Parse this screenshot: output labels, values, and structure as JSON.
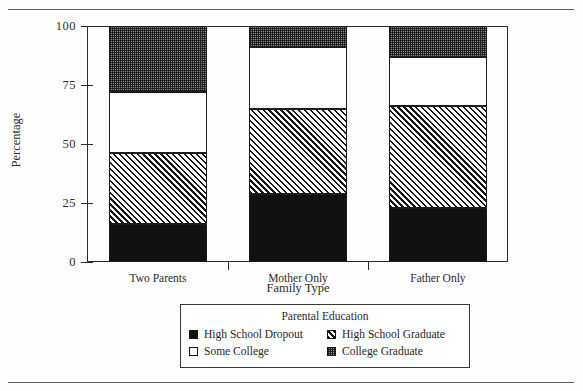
{
  "chart_data": {
    "type": "bar",
    "subtype": "stacked-100",
    "title": "",
    "xlabel": "Family Type",
    "ylabel": "Percentage",
    "ylim": [
      0,
      100
    ],
    "yticks": [
      0,
      25,
      50,
      75,
      100
    ],
    "ytick_labels": [
      "0",
      "25",
      "50",
      "75",
      "100"
    ],
    "grid": false,
    "legend_position": "bottom-center",
    "legend_title": "Parental Education",
    "categories": [
      "Two Parents",
      "Mother Only",
      "Father Only"
    ],
    "series": [
      {
        "name": "High School Dropout",
        "pattern": "solid-black",
        "values": [
          16,
          29,
          23
        ]
      },
      {
        "name": "High School Graduate",
        "pattern": "diagonal-hatch",
        "values": [
          30,
          36,
          43
        ]
      },
      {
        "name": "Some College",
        "pattern": "open-white",
        "values": [
          26,
          26,
          21
        ]
      },
      {
        "name": "College Graduate",
        "pattern": "dotted-gray",
        "values": [
          28,
          9,
          13
        ]
      }
    ],
    "cumulative_tops": {
      "Two Parents": [
        16,
        46,
        72,
        100
      ],
      "Mother Only": [
        29,
        65,
        91,
        100
      ],
      "Father Only": [
        23,
        66,
        87,
        100
      ]
    }
  },
  "legend": {
    "title": "Parental Education",
    "items": [
      {
        "label": "High School Dropout",
        "swatch": "solid-black-swatch"
      },
      {
        "label": "High School Graduate",
        "swatch": "hatch-swatch"
      },
      {
        "label": "Some College",
        "swatch": "open-swatch"
      },
      {
        "label": "College Graduate",
        "swatch": "dotted-swatch"
      }
    ]
  },
  "axes": {
    "y_title": "Percentage",
    "x_title": "Family Type",
    "y_tick_labels": [
      "100",
      "75",
      "50",
      "25",
      "0"
    ],
    "x_tick_labels": [
      "Two Parents",
      "Mother Only",
      "Father Only"
    ]
  }
}
